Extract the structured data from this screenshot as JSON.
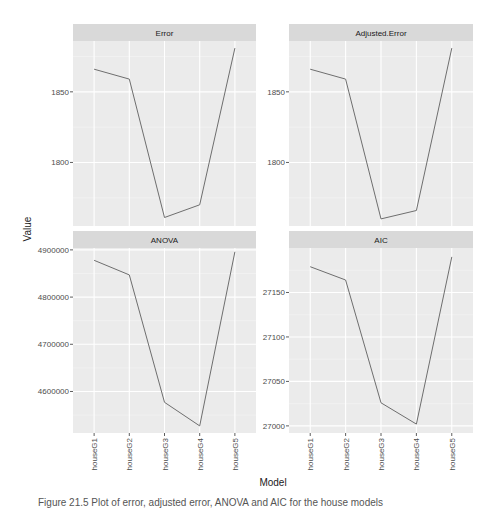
{
  "chart_data": {
    "type": "line",
    "layout": "facet_wrap 2x2, free y scales",
    "xlabel": "Model",
    "ylabel": "Value",
    "categories": [
      "houseG1",
      "houseG2",
      "houseG3",
      "houseG4",
      "houseG5"
    ],
    "line_color": "#6e6e6e",
    "panel_background": "#ebebeb",
    "strip_background": "#d9d9d9",
    "grid": true,
    "legend": "none",
    "panels": [
      {
        "title": "Error",
        "values": [
          1866,
          1859,
          1761,
          1770,
          1881
        ],
        "ylim": [
          1755,
          1886
        ],
        "yticks": [
          1800,
          1850
        ],
        "ytick_labels": [
          "1800",
          "1850"
        ]
      },
      {
        "title": "Adjusted.Error",
        "values": [
          1866,
          1859,
          1760,
          1766,
          1881
        ],
        "ylim": [
          1755,
          1886
        ],
        "yticks": [
          1800,
          1850
        ],
        "ytick_labels": [
          "1800",
          "1850"
        ]
      },
      {
        "title": "ANOVA",
        "values": [
          4878000,
          4847000,
          4577000,
          4527000,
          4896000
        ],
        "ylim": [
          4512000,
          4904000
        ],
        "yticks": [
          4600000,
          4700000,
          4800000,
          4900000
        ],
        "ytick_labels": [
          "4600000",
          "4700000",
          "4800000",
          "4900000"
        ]
      },
      {
        "title": "AIC",
        "values": [
          27179,
          27164,
          27026,
          27002,
          27190
        ],
        "ylim": [
          26992,
          27200
        ],
        "yticks": [
          27000,
          27050,
          27100,
          27150
        ],
        "ytick_labels": [
          "27000",
          "27050",
          "27100",
          "27150"
        ]
      }
    ]
  },
  "caption": "Figure 21.5   Plot of error, adjusted error, ANOVA and AIC for the house models"
}
